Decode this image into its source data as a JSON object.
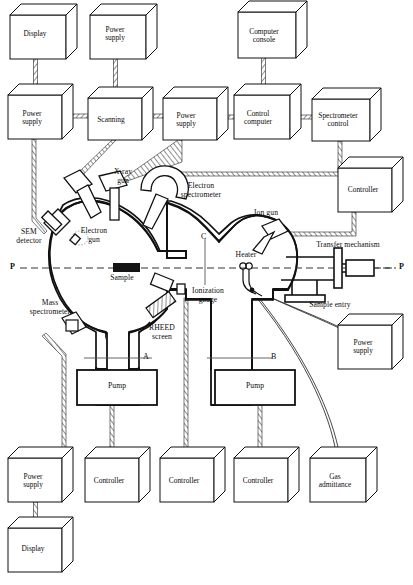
{
  "figure": {
    "axis_markers": {
      "plane_left": "P",
      "plane_right": "P",
      "section_a": "A",
      "section_b": "B",
      "section_c": "C"
    }
  },
  "instrument_boxes": {
    "row_top": [
      {
        "id": "display-top",
        "label": "Display",
        "x": 10,
        "y": 15,
        "w": 56,
        "h": 44
      },
      {
        "id": "power-supply-top",
        "label": "Power\nsupply",
        "x": 90,
        "y": 15,
        "w": 56,
        "h": 44
      },
      {
        "id": "computer-console",
        "label": "Computer\nconsole",
        "x": 238,
        "y": 12,
        "w": 58,
        "h": 46
      }
    ],
    "row_second": [
      {
        "id": "power-supply-left",
        "label": "Power\nsupply",
        "x": 8,
        "y": 95,
        "w": 54,
        "h": 44
      },
      {
        "id": "scanning",
        "label": "Scanning",
        "x": 88,
        "y": 98,
        "w": 54,
        "h": 42
      },
      {
        "id": "power-supply-mid",
        "label": "Power\nsupply",
        "x": 163,
        "y": 98,
        "w": 54,
        "h": 42
      },
      {
        "id": "control-computer",
        "label": "Control\ncomputer",
        "x": 234,
        "y": 95,
        "w": 56,
        "h": 44
      },
      {
        "id": "spectrometer-control",
        "label": "Spectrometer\ncontrol",
        "x": 312,
        "y": 99,
        "w": 58,
        "h": 42
      }
    ],
    "right_side": [
      {
        "id": "controller-right-upper",
        "label": "Controller",
        "x": 338,
        "y": 168,
        "w": 54,
        "h": 44
      },
      {
        "id": "power-supply-right",
        "label": "Power\nsupply",
        "x": 338,
        "y": 325,
        "w": 54,
        "h": 44
      }
    ],
    "row_bottom": [
      {
        "id": "power-supply-bottom",
        "label": "Power\nsupply",
        "x": 8,
        "y": 458,
        "w": 54,
        "h": 44
      },
      {
        "id": "controller-b1",
        "label": "Controller",
        "x": 85,
        "y": 458,
        "w": 54,
        "h": 44
      },
      {
        "id": "controller-b2",
        "label": "Controller",
        "x": 160,
        "y": 458,
        "w": 54,
        "h": 44
      },
      {
        "id": "controller-b3",
        "label": "Controller",
        "x": 234,
        "y": 458,
        "w": 54,
        "h": 44
      },
      {
        "id": "gas-admittance",
        "label": "Gas\nadmittance",
        "x": 310,
        "y": 458,
        "w": 56,
        "h": 44
      }
    ],
    "row_bottom_2": [
      {
        "id": "display-bottom",
        "label": "Display",
        "x": 8,
        "y": 528,
        "w": 54,
        "h": 44
      }
    ]
  },
  "chamber_components": [
    {
      "id": "sem-detector",
      "label": "SEM\ndetector",
      "x": 8,
      "y": 230,
      "w": 42
    },
    {
      "id": "electron-gun",
      "label": "Electron\ngun",
      "x": 72,
      "y": 226,
      "w": 44
    },
    {
      "id": "x-ray-gun",
      "label": "X-ray\ngun",
      "x": 104,
      "y": 169,
      "w": 36
    },
    {
      "id": "electron-spectrometer",
      "label": "Electron\nspectrometer",
      "x": 172,
      "y": 184,
      "w": 58
    },
    {
      "id": "ion-gun",
      "label": "Ion gun",
      "x": 248,
      "y": 210,
      "w": 34
    },
    {
      "id": "transfer-mechanism",
      "label": "Transfer mechanism",
      "x": 306,
      "y": 243,
      "w": 86
    },
    {
      "id": "heater",
      "label": "Heater",
      "x": 233,
      "y": 253,
      "w": 30
    },
    {
      "id": "sample",
      "label": "Sample",
      "x": 103,
      "y": 275,
      "w": 36
    },
    {
      "id": "sample-entry",
      "label": "Sample entry",
      "x": 303,
      "y": 302,
      "w": 58
    },
    {
      "id": "ionization-gauge",
      "label": "Ionization\ngauge",
      "x": 186,
      "y": 288,
      "w": 44
    },
    {
      "id": "mass-spectrometer",
      "label": "Mass\nspectrometer",
      "x": 24,
      "y": 300,
      "w": 56
    },
    {
      "id": "rheed-screen",
      "label": "RHEED\nscreen",
      "x": 143,
      "y": 325,
      "w": 38
    },
    {
      "id": "pump-left",
      "label": "Pump",
      "x": 77,
      "y": 370,
      "w": 80,
      "h": 34
    },
    {
      "id": "pump-right",
      "label": "Pump",
      "x": 215,
      "y": 370,
      "w": 80,
      "h": 34
    }
  ],
  "colors": {
    "ink": "#111111",
    "line": "#1a1a1a",
    "hatch": "#444444",
    "sample_fill": "#151515",
    "dashed_axis": "#333333"
  }
}
